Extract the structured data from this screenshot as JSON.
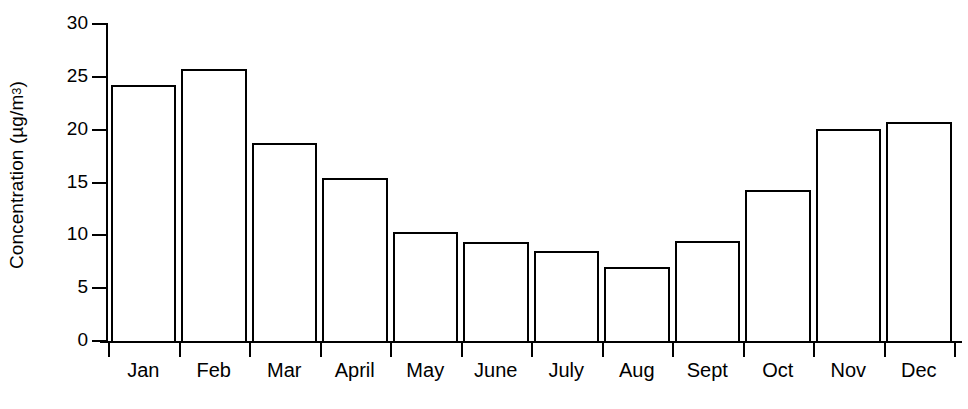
{
  "chart_data": {
    "type": "bar",
    "title": "",
    "xlabel": "",
    "ylabel": "Concentration (µg/m³)",
    "ylabel_main": "Concentration (µg/m",
    "ylabel_sup": "3",
    "ylabel_close": ")",
    "categories": [
      "Jan",
      "Feb",
      "Mar",
      "April",
      "May",
      "June",
      "July",
      "Aug",
      "Sept",
      "Oct",
      "Nov",
      "Dec"
    ],
    "values": [
      24.2,
      25.7,
      18.7,
      15.4,
      10.3,
      9.4,
      8.5,
      7.0,
      9.5,
      14.3,
      20.1,
      20.7
    ],
    "ylim": [
      0,
      30
    ],
    "yticks": [
      0,
      5,
      10,
      15,
      20,
      25,
      30
    ],
    "ytick_labels": [
      "0",
      "5",
      "10",
      "15",
      "20",
      "25",
      "30"
    ],
    "grid": false,
    "legend": false,
    "bar_fill": "#ffffff",
    "bar_edge": "#000000",
    "background": "#ffffff"
  }
}
